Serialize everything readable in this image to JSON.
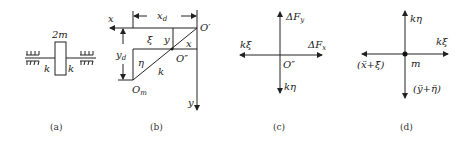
{
  "panels": {
    "a": {
      "caption": "(a)",
      "mass_label": "2m",
      "spring_left_label": "k",
      "spring_right_label": "k"
    },
    "b": {
      "caption": "(b)",
      "x_axis_label": "x",
      "y_axis_label": "y",
      "xd_label": "x",
      "xd_sub": "d",
      "yd_label": "y",
      "yd_sub": "d",
      "origin_prime": "O′",
      "origin_double_prime": "O″",
      "origin_m": "O",
      "origin_m_sub": "m",
      "xi_label": "ξ",
      "eta_label": "η",
      "y_label": "y",
      "x_label": "x",
      "k_label": "k"
    },
    "c": {
      "caption": "(c)",
      "force_y_label": "ΔF",
      "force_y_sub": "y",
      "force_x_label": "ΔF",
      "force_x_sub": "x",
      "k_xi_label": "kξ",
      "k_eta_label": "kη",
      "origin_label": "O″"
    },
    "d": {
      "caption": "(d)",
      "k_eta_label": "kη",
      "k_xi_label": "kξ",
      "mass_label": "m",
      "inertia_x_label": "(ẍ+ξ̈)",
      "inertia_y_label": "(ÿ+η̈)"
    }
  }
}
